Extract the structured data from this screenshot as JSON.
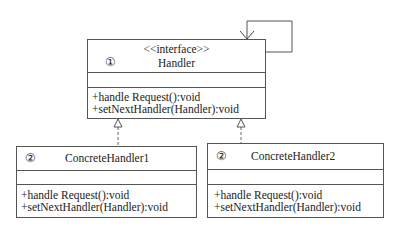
{
  "diagram": {
    "type": "UML class diagram",
    "classes": [
      {
        "id": "handler",
        "number": "①",
        "stereotype": "<<interface>>",
        "name": "Handler",
        "attributes": [],
        "methods": [
          "+handle Request():void",
          "+setNextHandler(Handler):void"
        ]
      },
      {
        "id": "concrete1",
        "number": "②",
        "name": "ConcreteHandler1",
        "attributes": [],
        "methods": [
          "+handle Request():void",
          "+setNextHandler(Handler):void"
        ]
      },
      {
        "id": "concrete2",
        "number": "②",
        "name": "ConcreteHandler2",
        "attributes": [],
        "methods": [
          "+handle Request():void",
          "+setNextHandler(Handler):void"
        ]
      }
    ],
    "relations": [
      {
        "from": "handler",
        "to": "handler",
        "kind": "self-association"
      },
      {
        "from": "concrete1",
        "to": "handler",
        "kind": "realization"
      },
      {
        "from": "concrete2",
        "to": "handler",
        "kind": "realization"
      }
    ]
  }
}
